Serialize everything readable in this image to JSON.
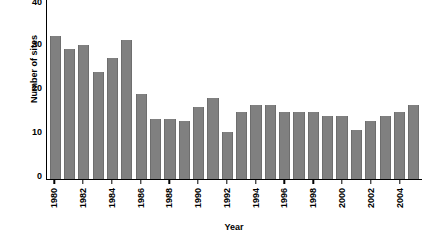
{
  "chart_data": {
    "type": "bar",
    "title": "",
    "xlabel": "Year",
    "ylabel": "Number of sites",
    "ylim": [
      0,
      40
    ],
    "yticks": [
      0,
      10,
      20,
      30,
      40
    ],
    "ytick_labels": [
      "0",
      "10",
      "20",
      "30",
      "40"
    ],
    "grid": false,
    "legend": null,
    "bar_color": "#808080",
    "axis_color": "#000000",
    "background_color": "#ffffff",
    "note_top_label_clipped": "40",
    "categories": [
      "1980",
      "1981",
      "1982",
      "1983",
      "1984",
      "1985",
      "1986",
      "1987",
      "1988",
      "1989",
      "1990",
      "1991",
      "1992",
      "1993",
      "1994",
      "1995",
      "1996",
      "1997",
      "1998",
      "1999",
      "2000",
      "2001",
      "2002",
      "2003",
      "2004",
      "2005"
    ],
    "values": [
      32,
      29,
      30,
      24,
      27,
      31,
      19,
      13.5,
      13.5,
      13,
      16,
      18,
      10.5,
      15,
      16.5,
      16.5,
      15,
      15,
      15,
      14,
      14,
      11,
      13,
      14,
      15,
      16.5
    ],
    "xtick_labels": [
      "1980",
      "",
      "1982",
      "",
      "1984",
      "",
      "1986",
      "",
      "1988",
      "",
      "1990",
      "",
      "1992",
      "",
      "1994",
      "",
      "1996",
      "",
      "1998",
      "",
      "2000",
      "",
      "2002",
      "",
      "2004",
      ""
    ]
  }
}
